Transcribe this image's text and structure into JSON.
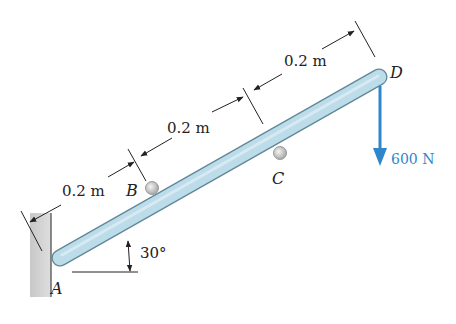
{
  "diagram": {
    "type": "statics-free-body",
    "points": [
      {
        "id": "A",
        "label": "A"
      },
      {
        "id": "B",
        "label": "B"
      },
      {
        "id": "C",
        "label": "C"
      },
      {
        "id": "D",
        "label": "D"
      }
    ],
    "dimensions": [
      {
        "label": "0.2 m",
        "between": "A-B"
      },
      {
        "label": "0.2 m",
        "between": "B-mid"
      },
      {
        "label": "0.2 m",
        "between": "mid-D"
      }
    ],
    "angle": {
      "label": "30°",
      "value_deg": 30
    },
    "force": {
      "label": "600 N",
      "point": "D",
      "direction": "down",
      "color": "#2f86c9"
    },
    "colors": {
      "bar_fill": "#b9dbe8",
      "bar_stroke": "#5f8797",
      "wall": "#d2d2d2",
      "dim_line": "#222222"
    }
  }
}
